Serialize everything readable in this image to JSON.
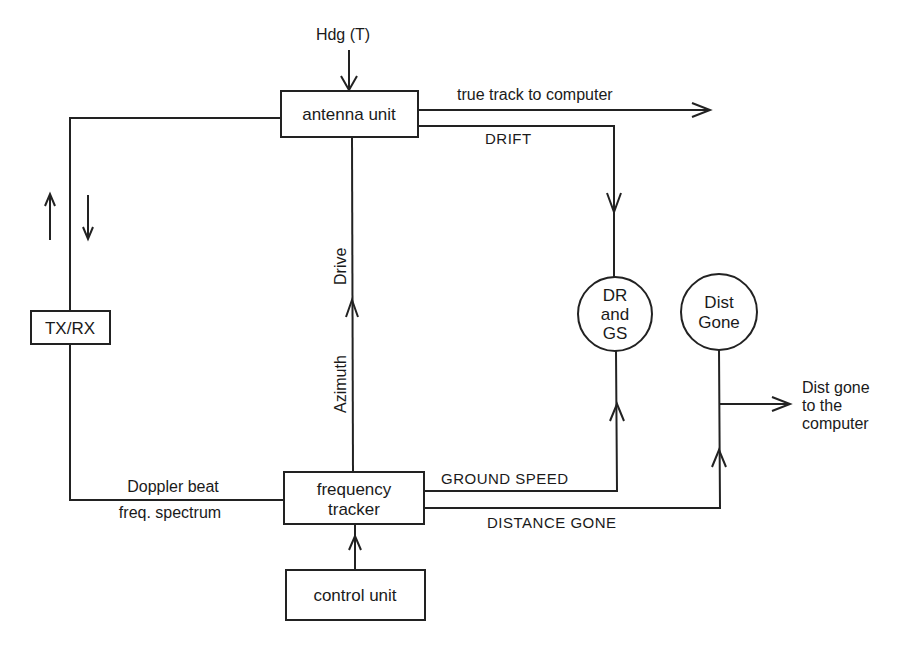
{
  "diagram": {
    "type": "block-diagram",
    "colors": {
      "line": "#222222",
      "background": "#ffffff",
      "text": "#1a1a1a"
    },
    "blocks": {
      "antenna_unit": "antenna unit",
      "tx_rx": "TX/RX",
      "frequency_tracker": {
        "line1": "frequency",
        "line2": "tracker"
      },
      "control_unit": "control unit"
    },
    "indicators": {
      "dr_gs": {
        "line1": "DR",
        "line2": "and",
        "line3": "GS"
      },
      "dist_gone": {
        "line1": "Dist",
        "line2": "Gone"
      }
    },
    "labels": {
      "heading_input": "Hdg (T)",
      "true_track": "true track to computer",
      "drift": "DRIFT",
      "drive": "Drive",
      "azimuth": "Azimuth",
      "doppler_line1": "Doppler beat",
      "doppler_line2": "freq. spectrum",
      "ground_speed": "GROUND SPEED",
      "distance_gone": "DISTANCE GONE",
      "dist_out_line1": "Dist gone",
      "dist_out_line2": "to the",
      "dist_out_line3": "computer"
    }
  }
}
